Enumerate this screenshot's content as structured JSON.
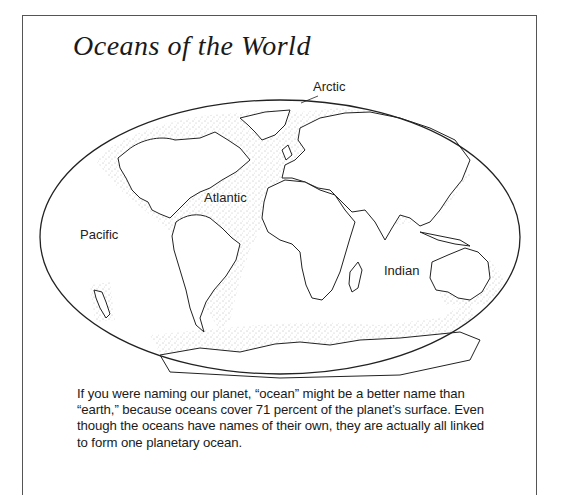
{
  "title": "Oceans of the World",
  "map": {
    "labels": {
      "arctic": "Arctic",
      "atlantic": "Atlantic",
      "pacific": "Pacific",
      "indian": "Indian"
    }
  },
  "body": {
    "paragraph": "If you were naming our planet, “ocean” might be a better name than “earth,” because oceans cover 71 percent of the planet’s surface. Even though the oceans have names of their own, they are actually all linked to form one planetary ocean."
  }
}
